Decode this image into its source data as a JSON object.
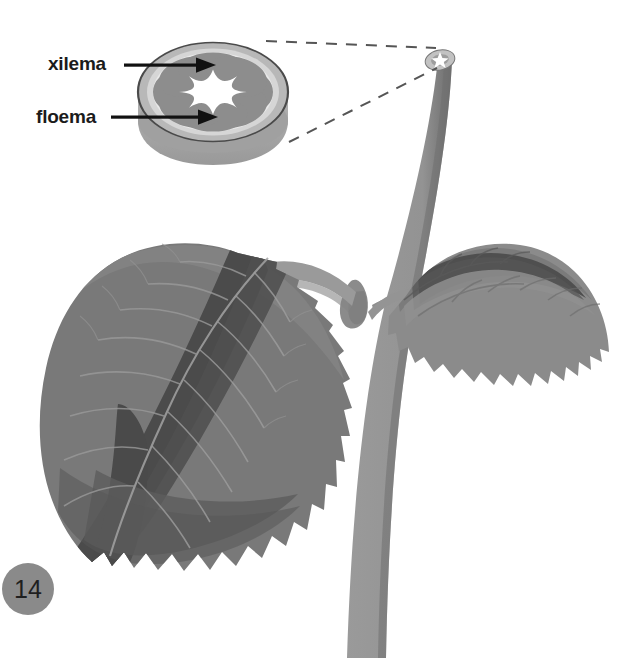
{
  "figure": {
    "number_badge": "14",
    "badge_color": "#8a8a8a",
    "background": "#ffffff"
  },
  "labels": [
    {
      "id": "xilema",
      "text": "xilema",
      "target": "inner-vascular-bundle"
    },
    {
      "id": "floema",
      "text": "floema",
      "target": "outer-vascular-bundle"
    }
  ],
  "cross_section": {
    "name": "stem-cross-section-disc",
    "bundle_count": 8,
    "outer_ring_color": "#b9b9b9",
    "cortex_color": "#d4d4d4",
    "bundle_color": "#8d8d8d",
    "core_color": "#fdfdfd",
    "side_wall_color": "#a8a8a8",
    "outline_color": "#4a4a4a"
  },
  "plant": {
    "stem_color": "#909090",
    "stem_shadow_color": "#6f6f6f",
    "leaf_color": "#797979",
    "leaf_shadow_color": "#4d4d4d",
    "leaf_light_color": "#8c8c8c",
    "vein_color": "#a0a0a0",
    "parts": [
      {
        "name": "main-stem"
      },
      {
        "name": "left-leaf"
      },
      {
        "name": "right-leaf"
      },
      {
        "name": "left-petiole"
      },
      {
        "name": "right-petiole"
      },
      {
        "name": "axillary-bud"
      },
      {
        "name": "stem-tip-cross-section"
      }
    ]
  },
  "callout": {
    "name": "magnification-callout",
    "style": "dashed",
    "color": "#555555",
    "from": "stem-tip-cross-section",
    "to": "stem-cross-section-disc"
  }
}
